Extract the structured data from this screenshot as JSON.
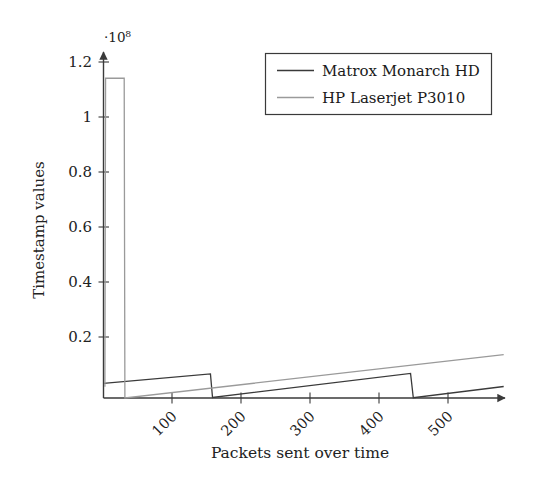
{
  "chart_data": {
    "type": "line",
    "title": "",
    "xlabel": "Packets sent over time",
    "ylabel": "Timestamp values",
    "y_multiplier_label": "·10⁸",
    "y_multiplier_value": 100000000,
    "xlim": [
      0,
      580
    ],
    "ylim": [
      0,
      1.28
    ],
    "y_tick_labels": [
      "0.2",
      "0.4",
      "0.6",
      "0.8",
      "1",
      "1.2"
    ],
    "y_tick_values": [
      0.2,
      0.4,
      0.6,
      0.8,
      1.0,
      1.2
    ],
    "x_tick_labels": [
      "100",
      "200",
      "300",
      "400",
      "500"
    ],
    "x_tick_values": [
      100,
      200,
      300,
      400,
      500
    ],
    "grid": false,
    "legend_position": "top-right",
    "axis_style": "arrow-ends",
    "series": [
      {
        "name": "Matrox Monarch HD",
        "color": "#3a3a3a",
        "points": [
          [
            0,
            0.052
          ],
          [
            155,
            0.086
          ],
          [
            158,
            0.002
          ],
          [
            445,
            0.088
          ],
          [
            449,
            0.001
          ],
          [
            580,
            0.041
          ]
        ]
      },
      {
        "name": "HP Laserjet P3010",
        "color": "#9a9a9a",
        "points": [
          [
            2,
            0.04
          ],
          [
            3,
            1.142
          ],
          [
            30,
            1.142
          ],
          [
            31,
            0.0
          ],
          [
            580,
            0.155
          ]
        ]
      }
    ]
  },
  "legend": {
    "entries": [
      {
        "label": "Matrox Monarch HD",
        "color": "#3a3a3a"
      },
      {
        "label": "HP Laserjet P3010",
        "color": "#9a9a9a"
      }
    ]
  }
}
